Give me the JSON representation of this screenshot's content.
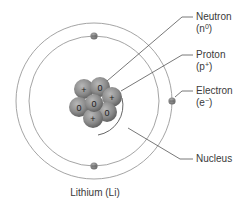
{
  "title": "Lithium (Li)",
  "labels": {
    "neutron": {
      "name": "Neutron",
      "symbol_base": "(n",
      "symbol_sup": "0",
      "symbol_close": ")"
    },
    "proton": {
      "name": "Proton",
      "symbol_base": "(p",
      "symbol_sup": "+",
      "symbol_close": ")"
    },
    "electron": {
      "name": "Electron",
      "symbol_base": "(e",
      "symbol_sup": "−",
      "symbol_close": ")"
    },
    "nucleus": {
      "name": "Nucleus"
    }
  },
  "nucleus_particles": [
    {
      "type": "proton",
      "mark": "+",
      "cx": 84,
      "cy": 89
    },
    {
      "type": "neutron",
      "mark": "0",
      "cx": 100,
      "cy": 87
    },
    {
      "type": "proton",
      "mark": "+",
      "cx": 112,
      "cy": 97
    },
    {
      "type": "neutron",
      "mark": "0",
      "cx": 79,
      "cy": 107
    },
    {
      "type": "neutron",
      "mark": "0",
      "cx": 107,
      "cy": 112
    },
    {
      "type": "proton",
      "mark": "+",
      "cx": 93,
      "cy": 118
    },
    {
      "type": "neutron",
      "mark": "0",
      "cx": 94,
      "cy": 103
    }
  ],
  "electrons": [
    {
      "shell": "inner",
      "cx": 94,
      "cy": 36,
      "mark": "−"
    },
    {
      "shell": "inner",
      "cx": 94,
      "cy": 166,
      "mark": "−"
    },
    {
      "shell": "outer",
      "cx": 172,
      "cy": 101,
      "mark": "−"
    }
  ],
  "counts": {
    "protons": 3,
    "neutrons": 4,
    "electrons": 3
  },
  "colors": {
    "orbit": "#9a9a9a",
    "leader": "#555555",
    "particle_light": "#a9a9a9",
    "particle_dark": "#5e5e5e",
    "text": "#3a3a3a"
  }
}
